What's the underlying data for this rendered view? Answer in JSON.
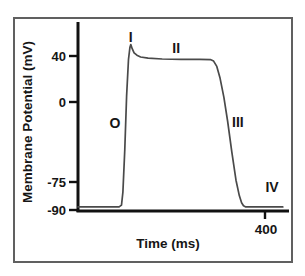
{
  "figure": {
    "y_axis_label": "Membrane Potential (mV)",
    "x_axis_label": "Time (ms)",
    "y_tick_labels": [
      "40",
      "0",
      "-75",
      "-90"
    ],
    "x_tick_labels": [
      "400"
    ]
  },
  "chart_data": {
    "type": "line",
    "title": "",
    "xlabel": "Time (ms)",
    "ylabel": "Membrane Potential (mV)",
    "xlim": [
      0,
      450
    ],
    "ylim": [
      -95,
      60
    ],
    "x_ticks": [
      400
    ],
    "y_ticks": [
      40,
      0,
      -75,
      -90
    ],
    "grid": false,
    "legend": "none",
    "series": [
      {
        "name": "cardiac-action-potential",
        "points": [
          [
            0,
            -88.5
          ],
          [
            88,
            -88.5
          ],
          [
            93,
            -87
          ],
          [
            96,
            -76
          ],
          [
            100,
            -40
          ],
          [
            104,
            5
          ],
          [
            108,
            36
          ],
          [
            111,
            46
          ],
          [
            113,
            48.5
          ],
          [
            116,
            45
          ],
          [
            120,
            41.5
          ],
          [
            126,
            39.5
          ],
          [
            134,
            38
          ],
          [
            150,
            37
          ],
          [
            180,
            36.3
          ],
          [
            220,
            36
          ],
          [
            260,
            36
          ],
          [
            283,
            35.8
          ],
          [
            290,
            34.5
          ],
          [
            297,
            30
          ],
          [
            304,
            20
          ],
          [
            312,
            4
          ],
          [
            320,
            -16
          ],
          [
            329,
            -42
          ],
          [
            338,
            -66
          ],
          [
            345,
            -79
          ],
          [
            350,
            -85
          ],
          [
            354,
            -87.5
          ],
          [
            359,
            -88.5
          ],
          [
            438,
            -88.5
          ]
        ]
      }
    ],
    "annotations": [
      {
        "label": "O",
        "x": 79,
        "y": -18
      },
      {
        "label": "I",
        "x": 113,
        "y": 55
      },
      {
        "label": "II",
        "x": 210,
        "y": 46
      },
      {
        "label": "III",
        "x": 342,
        "y": -17
      },
      {
        "label": "IV",
        "x": 415,
        "y": -72
      }
    ],
    "colors": {
      "curve": "#4a4a4a",
      "axis": "#111111",
      "frame": "#606060",
      "text": "#161616",
      "background": "#ffffff"
    }
  }
}
